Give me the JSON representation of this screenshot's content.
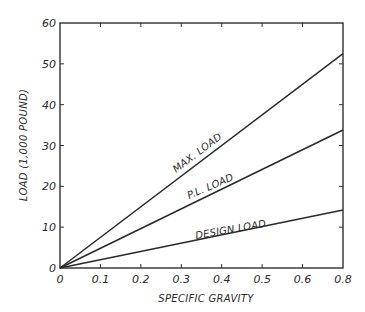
{
  "chart_data": {
    "type": "line",
    "title": "",
    "xlabel": "SPECIFIC GRAVITY",
    "ylabel": "LOAD (1,000 POUND)",
    "xlim": [
      0,
      0.8
    ],
    "ylim": [
      0,
      60
    ],
    "grid": false,
    "legend": "none (inline line labels)",
    "x_tick_labels": [
      "0",
      "0.1",
      "0.2",
      "0.3",
      "0.4",
      "0.5",
      "0.6",
      "0.8"
    ],
    "y_tick_labels": [
      "0",
      "10",
      "20",
      "30",
      "40",
      "50",
      "60"
    ],
    "x": [
      0,
      0.8
    ],
    "series": [
      {
        "name": "MAX. LOAD",
        "values": [
          0,
          52.5
        ]
      },
      {
        "name": "P.L. LOAD",
        "values": [
          0,
          33.8
        ]
      },
      {
        "name": "DESIGN LOAD",
        "values": [
          0,
          14.2
        ]
      }
    ],
    "line_color": "#2a2a2a",
    "background_color": "#ffffff"
  }
}
